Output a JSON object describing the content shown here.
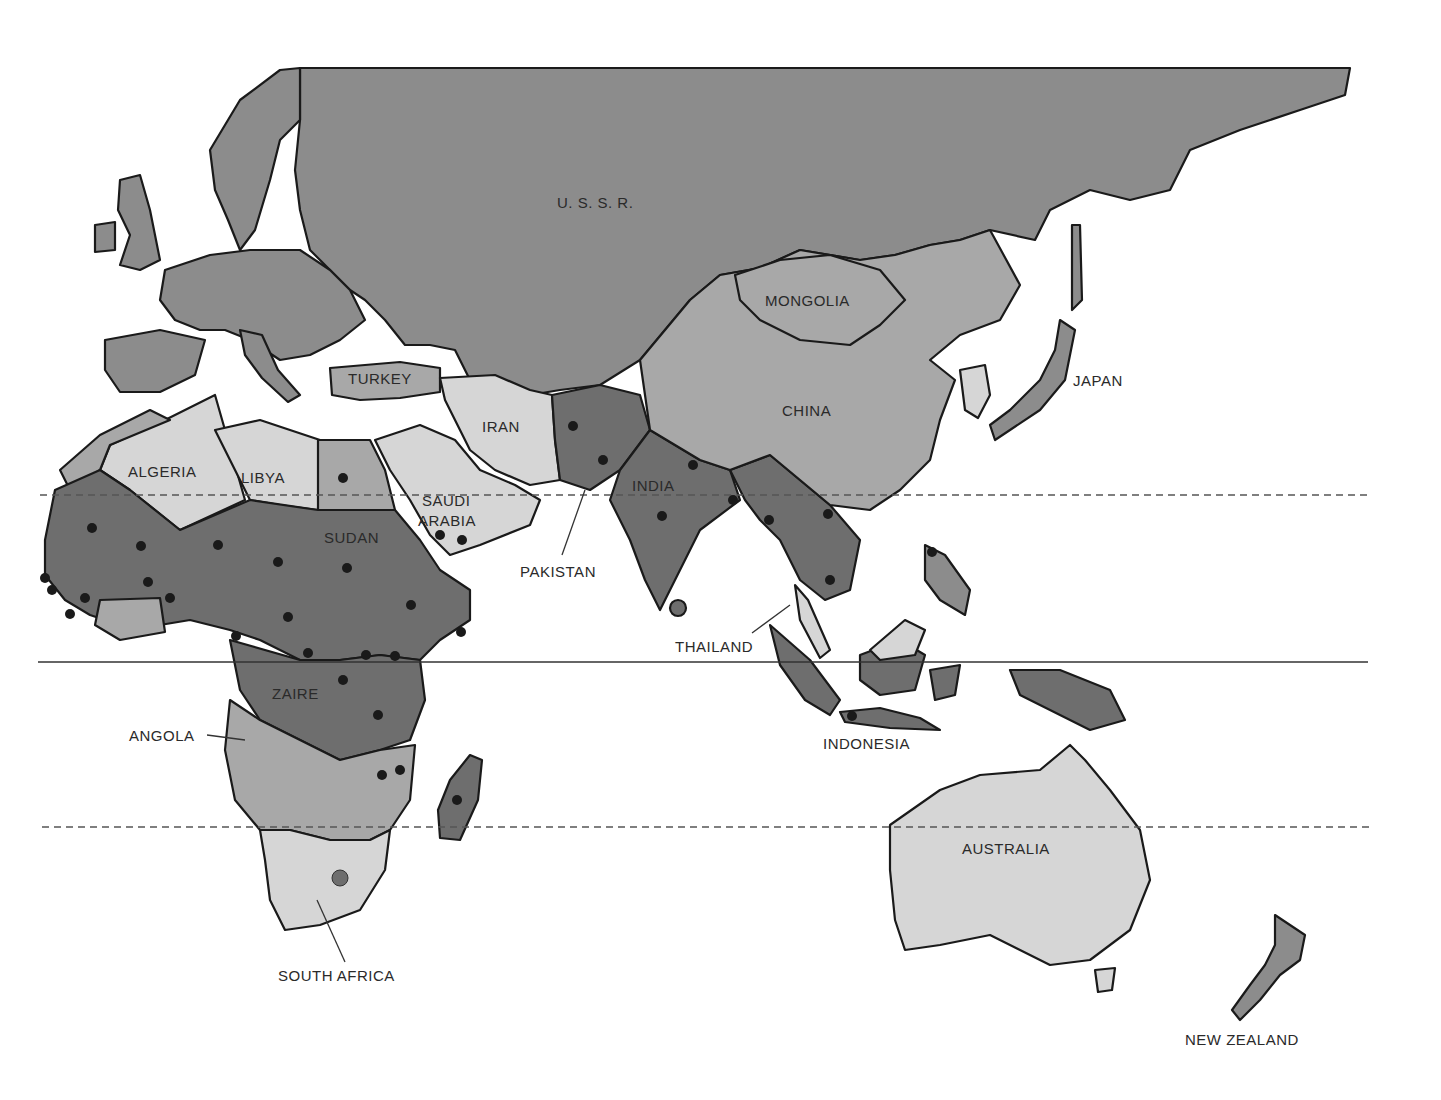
{
  "map": {
    "region": "Eastern Hemisphere",
    "shading_tiers": {
      "darkest": "#6e6e6e",
      "dark": "#8c8c8c",
      "medium": "#a8a8a8",
      "light": "#d6d6d6"
    },
    "dot_color": "#1a1a1a",
    "reference_lines": [
      {
        "name": "tropic-of-cancer",
        "style": "dashed",
        "y": 495
      },
      {
        "name": "equator",
        "style": "solid",
        "y": 662
      },
      {
        "name": "tropic-of-capricorn",
        "style": "dashed",
        "y": 827
      }
    ],
    "labels": {
      "ussr": "U. S. S. R.",
      "mongolia": "MONGOLIA",
      "china": "CHINA",
      "japan": "JAPAN",
      "turkey": "TURKEY",
      "iran": "IRAN",
      "algeria": "ALGERIA",
      "libya": "LIBYA",
      "saudi_arabia_1": "SAUDI",
      "saudi_arabia_2": "ARABIA",
      "india": "INDIA",
      "pakistan": "PAKISTAN",
      "sudan": "SUDAN",
      "thailand": "THAILAND",
      "zaire": "ZAIRE",
      "angola": "ANGOLA",
      "indonesia": "INDONESIA",
      "australia": "AUSTRALIA",
      "south_africa": "SOUTH AFRICA",
      "new_zealand": "NEW ZEALAND"
    }
  }
}
